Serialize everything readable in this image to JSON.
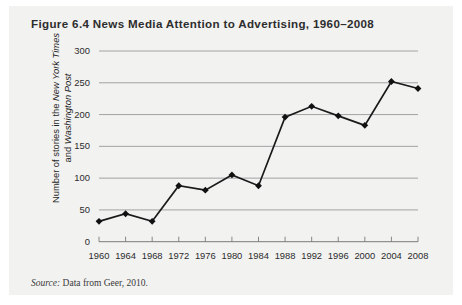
{
  "figure": {
    "title_prefix": "Figure 6.4",
    "title_main": "News Media Attention to Advertising, 1960–2008",
    "title_full": "Figure 6.4 News Media Attention to Advertising, 1960–2008",
    "source_label": "Source:",
    "source_text": "Data from Geer, 2010."
  },
  "chart_data": {
    "type": "line",
    "title": "News Media Attention to Advertising, 1960–2008",
    "xlabel": "",
    "ylabel": "Number of stories in the New York Times and Washington Post",
    "ylabel_part1": "Number of stories in the ",
    "ylabel_italic1": "New York Times",
    "ylabel_part2": "and ",
    "ylabel_italic2": "Washington Post",
    "categories": [
      1960,
      1964,
      1968,
      1972,
      1976,
      1980,
      1984,
      1988,
      1992,
      1996,
      2000,
      2004,
      2008
    ],
    "x_tick_labels": [
      "1960",
      "1964",
      "1968",
      "1972",
      "1976",
      "1980",
      "1984",
      "1988",
      "1992",
      "1996",
      "2000",
      "2004",
      "2008"
    ],
    "values": [
      32,
      44,
      32,
      88,
      81,
      105,
      88,
      196,
      213,
      198,
      183,
      252,
      241
    ],
    "y_tick_labels": [
      "0",
      "50",
      "100",
      "150",
      "200",
      "250",
      "300"
    ],
    "y_ticks": [
      0,
      50,
      100,
      150,
      200,
      250,
      300
    ],
    "ylim": [
      0,
      300
    ],
    "xlim": [
      1960,
      2008
    ],
    "grid": true,
    "legend": "none",
    "marker": "diamond",
    "line_color": "#1a1a1a",
    "marker_color": "#111111",
    "grid_color": "#9a9a9a",
    "panel_color": "#f2f2f1"
  }
}
